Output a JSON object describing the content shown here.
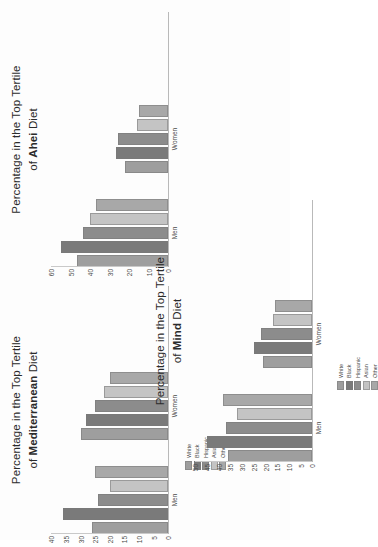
{
  "figure": {
    "caption": "Percentage in the Top Tertile of Diet Scores by Sex and Race/Ethnicity",
    "orientation": "rotated-90-ccw"
  },
  "legend": {
    "title": "Race/Ethnicity",
    "entries": [
      {
        "label": "White",
        "color": "#9e9e9e"
      },
      {
        "label": "Black",
        "color": "#7a7a7a"
      },
      {
        "label": "Hispanic",
        "color": "#8c8c8c"
      },
      {
        "label": "Asian",
        "color": "#c4c4c4"
      },
      {
        "label": "Other",
        "color": "#a8a8a8"
      }
    ]
  },
  "chart_data": [
    {
      "id": "ahei",
      "type": "bar",
      "title_line1": "Percentage in the Top Tertile",
      "title_line2_prefix": "of ",
      "title_line2_bold": "Ahei",
      "title_line2_suffix": " Diet",
      "xlabel": "",
      "ylabel": "",
      "categories": [
        "Men",
        "Women"
      ],
      "ylim": [
        0,
        60
      ],
      "yticks": [
        60,
        50,
        40,
        30,
        20,
        10,
        0
      ],
      "grid": false,
      "legend_position": "none",
      "series": [
        {
          "name": "White",
          "color": "#9e9e9e",
          "values": [
            47,
            22
          ]
        },
        {
          "name": "Black",
          "color": "#7a7a7a",
          "values": [
            55,
            27
          ]
        },
        {
          "name": "Hispanic",
          "color": "#8c8c8c",
          "values": [
            44,
            26
          ]
        },
        {
          "name": "Asian",
          "color": "#c4c4c4",
          "values": [
            40,
            16
          ]
        },
        {
          "name": "Other",
          "color": "#a8a8a8",
          "values": [
            37,
            15
          ]
        }
      ]
    },
    {
      "id": "mediterranean",
      "type": "bar",
      "title_line1": "Percentage in the Top Tertile",
      "title_line2_prefix": "of ",
      "title_line2_bold": "Mediterranean",
      "title_line2_suffix": " Diet",
      "xlabel": "",
      "ylabel": "",
      "categories": [
        "Men",
        "Women"
      ],
      "ylim": [
        0,
        40
      ],
      "yticks": [
        40,
        35,
        30,
        25,
        20,
        15,
        10,
        5,
        0
      ],
      "grid": false,
      "legend_position": "below-axis",
      "series": [
        {
          "name": "White",
          "color": "#9e9e9e",
          "values": [
            26,
            30
          ]
        },
        {
          "name": "Black",
          "color": "#7a7a7a",
          "values": [
            36,
            28
          ]
        },
        {
          "name": "Hispanic",
          "color": "#8c8c8c",
          "values": [
            24,
            25
          ]
        },
        {
          "name": "Asian",
          "color": "#c4c4c4",
          "values": [
            20,
            22
          ]
        },
        {
          "name": "Other",
          "color": "#a8a8a8",
          "values": [
            25,
            20
          ]
        }
      ]
    },
    {
      "id": "mind",
      "type": "bar",
      "title_line1": "Percentage in the Top Tertile",
      "title_line2_prefix": "of ",
      "title_line2_bold": "Mind",
      "title_line2_suffix": " Diet",
      "xlabel": "",
      "ylabel": "",
      "categories": [
        "Men",
        "Women"
      ],
      "ylim": [
        0,
        50
      ],
      "yticks": [
        50,
        45,
        40,
        35,
        30,
        25,
        20,
        15,
        10,
        5,
        0
      ],
      "grid": false,
      "legend_position": "below-axis",
      "series": [
        {
          "name": "White",
          "color": "#9e9e9e",
          "values": [
            36,
            21
          ]
        },
        {
          "name": "Black",
          "color": "#7a7a7a",
          "values": [
            45,
            25
          ]
        },
        {
          "name": "Hispanic",
          "color": "#8c8c8c",
          "values": [
            37,
            22
          ]
        },
        {
          "name": "Asian",
          "color": "#c4c4c4",
          "values": [
            32,
            17
          ]
        },
        {
          "name": "Other",
          "color": "#a8a8a8",
          "values": [
            38,
            16
          ]
        }
      ]
    }
  ]
}
